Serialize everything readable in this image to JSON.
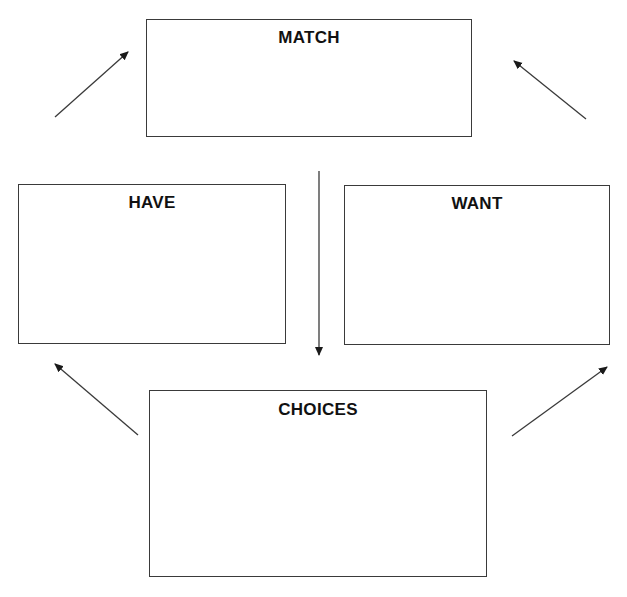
{
  "diagram": {
    "boxes": {
      "match": {
        "label": "MATCH"
      },
      "have": {
        "label": "HAVE"
      },
      "want": {
        "label": "WANT"
      },
      "choices": {
        "label": "CHOICES"
      }
    },
    "arrows": [
      {
        "id": "left-to-match",
        "from": "have-side",
        "to": "match"
      },
      {
        "id": "right-to-match",
        "from": "want-side",
        "to": "match"
      },
      {
        "id": "match-down",
        "from": "match",
        "to": "choices"
      },
      {
        "id": "choices-to-have",
        "from": "choices",
        "to": "have"
      },
      {
        "id": "choices-to-want",
        "from": "choices",
        "to": "want"
      }
    ],
    "colors": {
      "stroke": "#3a3a3a",
      "text": "#111111",
      "background": "#ffffff"
    }
  }
}
